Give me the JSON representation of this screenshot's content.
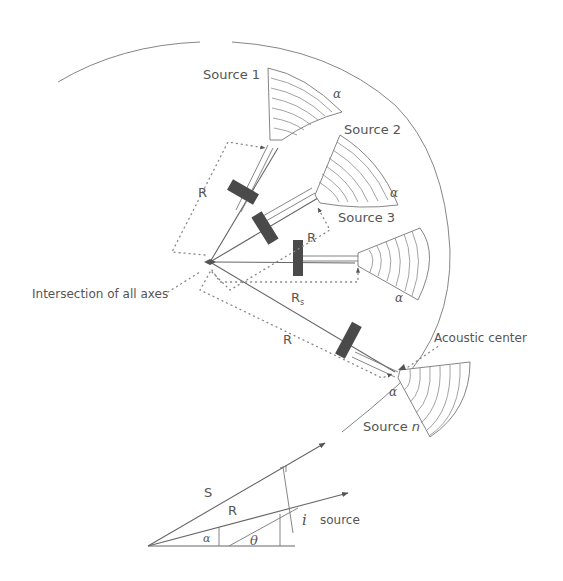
{
  "figure": {
    "sources": [
      {
        "label": "Source 1",
        "angle_label": "α"
      },
      {
        "label": "Source 2",
        "angle_label": "α"
      },
      {
        "label": "Source 3",
        "angle_label": "α"
      },
      {
        "label_prefix": "Source ",
        "label_italic": "n",
        "angle_label": "α"
      }
    ],
    "distance_labels": {
      "r1": "R",
      "r2": "R",
      "r3_main": "R",
      "r3_sub": "s",
      "rn": "R"
    },
    "callouts": {
      "intersection": "Intersection of all axes",
      "acoustic_center": "Acoustic center"
    },
    "inset": {
      "s_label": "S",
      "r_label": "R",
      "alpha_label": "α",
      "theta_label": "θ",
      "i_label": "i",
      "source_label": "source"
    },
    "colors": {
      "line": "#777777",
      "block": "#4a4a4a",
      "text": "#555555"
    }
  }
}
